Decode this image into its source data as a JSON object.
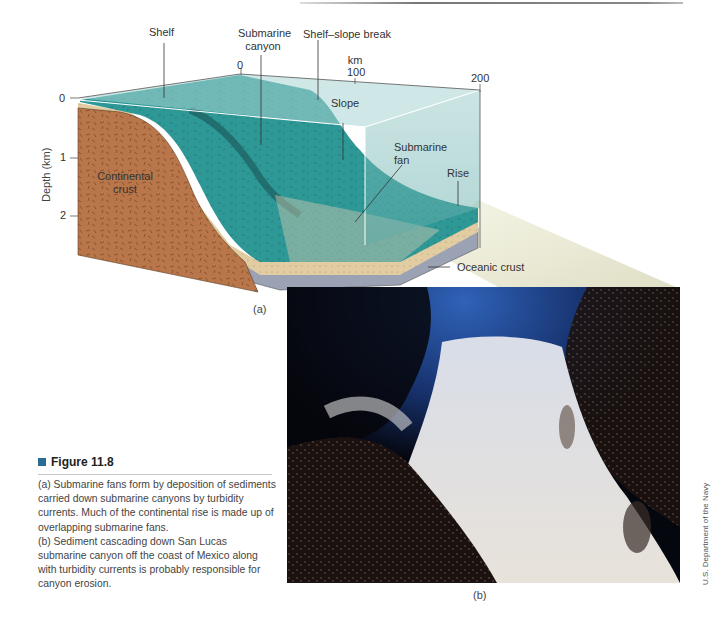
{
  "figure": {
    "number_label": "Figure 11.8",
    "accent_color": "#2a6d94",
    "panel_a_label": "(a)",
    "panel_b_label": "(b)",
    "caption_a": "(a) Submarine fans form by deposition of sediments carried down submarine canyons by turbidity currents. Much of the continental rise is made up of overlapping submarine fans.",
    "caption_b": "(b) Sediment cascading down San Lucas submarine canyon off the coast of Mexico along with turbidity currents is probably responsible for canyon erosion.",
    "photo_credit": "U.S. Department of the Navy"
  },
  "diagram": {
    "labels": {
      "shelf": "Shelf",
      "submarine_canyon_1": "Submarine",
      "submarine_canyon_2": "canyon",
      "shelf_slope_break": "Shelf–slope break",
      "slope": "Slope",
      "submarine_fan_1": "Submarine",
      "submarine_fan_2": "fan",
      "rise": "Rise",
      "continental_crust_1": "Continental",
      "continental_crust_2": "crust",
      "oceanic_crust": "Oceanic crust"
    },
    "distance_axis": {
      "unit": "km",
      "ticks": [
        "0",
        "100",
        "200"
      ]
    },
    "depth_axis": {
      "title": "Depth (km)",
      "ticks": [
        "0",
        "1",
        "2"
      ]
    },
    "colors": {
      "water_top": "#9ccfcb",
      "seafloor": "#2e9a98",
      "continental_crust": "#b8764a",
      "sediment": "#e0caa0",
      "oceanic_crust": "#9ba3b5"
    }
  }
}
